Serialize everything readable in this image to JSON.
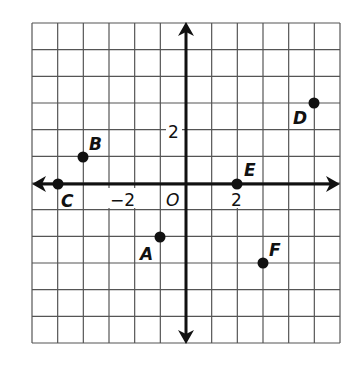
{
  "chart_data": {
    "type": "scatter",
    "title": "",
    "xlabel": "",
    "ylabel": "",
    "xlim": [
      -6,
      6
    ],
    "ylim": [
      -6,
      6
    ],
    "grid": true,
    "grid_step": 1,
    "tick_labels": {
      "x": [
        {
          "value": -2,
          "label": "−2"
        },
        {
          "value": 2,
          "label": "2"
        }
      ],
      "y": [
        {
          "value": 2,
          "label": "2"
        }
      ],
      "origin": "O"
    },
    "points": [
      {
        "label": "A",
        "x": -1,
        "y": -2
      },
      {
        "label": "B",
        "x": -4,
        "y": 1
      },
      {
        "label": "C",
        "x": -5,
        "y": 0
      },
      {
        "label": "D",
        "x": 5,
        "y": 3
      },
      {
        "label": "E",
        "x": 2,
        "y": 0
      },
      {
        "label": "F",
        "x": 3,
        "y": -3
      }
    ]
  },
  "labels": {
    "origin": "O",
    "x_neg2": "−2",
    "x_pos2": "2",
    "y_pos2": "2",
    "A": "A",
    "B": "B",
    "C": "C",
    "D": "D",
    "E": "E",
    "F": "F"
  },
  "colors": {
    "grid": "#555555",
    "axis": "#111111",
    "point": "#111111"
  }
}
